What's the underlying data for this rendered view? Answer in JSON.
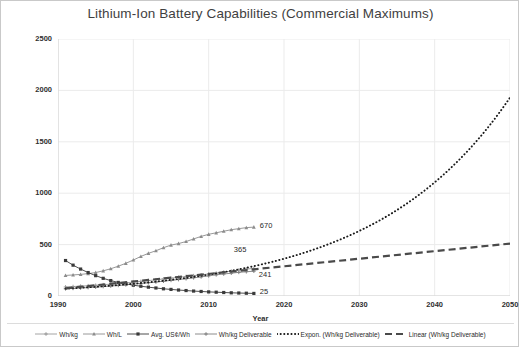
{
  "chart_data": {
    "type": "line",
    "title": "Lithium-Ion Battery Capabilities (Commercial Maximums)",
    "xlabel": "Year",
    "ylabel": "Value (See Legend)",
    "xlim": [
      1990,
      2050
    ],
    "ylim": [
      0,
      2500
    ],
    "xticks": [
      "1990",
      "2000",
      "2010",
      "2020",
      "2030",
      "2040",
      "2050"
    ],
    "yticks": [
      "0",
      "500",
      "1000",
      "1500",
      "2000",
      "2500"
    ],
    "grid": true,
    "legend_position": "bottom",
    "series": [
      {
        "name": "Wh/kg",
        "marker": "cross",
        "style": "solid",
        "x": [
          1991,
          1992,
          1993,
          1994,
          1995,
          1996,
          1997,
          1998,
          1999,
          2000,
          2001,
          2002,
          2003,
          2004,
          2005,
          2006,
          2007,
          2008,
          2009,
          2010,
          2011,
          2012,
          2013,
          2014,
          2015,
          2016
        ],
        "values": [
          88,
          92,
          96,
          100,
          104,
          110,
          115,
          122,
          128,
          135,
          142,
          150,
          158,
          166,
          174,
          182,
          190,
          198,
          206,
          214,
          222,
          232,
          242,
          252,
          262,
          268
        ]
      },
      {
        "name": "Wh/L",
        "marker": "triangle",
        "style": "solid",
        "x": [
          1991,
          1992,
          1993,
          1994,
          1995,
          1996,
          1997,
          1998,
          1999,
          2000,
          2001,
          2002,
          2003,
          2004,
          2005,
          2006,
          2007,
          2008,
          2009,
          2010,
          2011,
          2012,
          2013,
          2014,
          2015,
          2016
        ],
        "values": [
          200,
          205,
          210,
          218,
          228,
          245,
          265,
          290,
          318,
          350,
          385,
          415,
          440,
          470,
          495,
          510,
          530,
          555,
          580,
          600,
          615,
          630,
          645,
          655,
          665,
          670
        ]
      },
      {
        "name": "Avg. US¢/Wh",
        "marker": "square",
        "style": "solid",
        "x": [
          1991,
          1992,
          1993,
          1994,
          1995,
          1996,
          1997,
          1998,
          1999,
          2000,
          2001,
          2002,
          2003,
          2004,
          2005,
          2006,
          2007,
          2008,
          2009,
          2010,
          2011,
          2012,
          2013,
          2014,
          2015,
          2016
        ],
        "values": [
          345,
          300,
          262,
          228,
          198,
          172,
          150,
          132,
          118,
          105,
          95,
          86,
          78,
          70,
          64,
          58,
          53,
          48,
          44,
          40,
          37,
          34,
          31,
          29,
          27,
          25
        ]
      },
      {
        "name": "Wh/kg Deliverable",
        "marker": "cross",
        "style": "solid",
        "x": [
          1991,
          1992,
          1993,
          1994,
          1995,
          1996,
          1997,
          1998,
          1999,
          2000,
          2001,
          2002,
          2003,
          2004,
          2005,
          2006,
          2007,
          2008,
          2009,
          2010,
          2011,
          2012,
          2013,
          2014,
          2015,
          2016
        ],
        "values": [
          70,
          74,
          78,
          82,
          86,
          92,
          97,
          103,
          109,
          115,
          122,
          129,
          136,
          144,
          152,
          160,
          168,
          177,
          186,
          196,
          206,
          214,
          222,
          230,
          236,
          241
        ]
      },
      {
        "name": "Expon. (Wh/kg Deliverable)",
        "style": "dotted",
        "trend": "exponential",
        "x": [
          1991,
          2050
        ],
        "values": [
          72,
          1930
        ]
      },
      {
        "name": "Linear (Wh/kg Deliverable)",
        "style": "dashed",
        "trend": "linear",
        "x": [
          1991,
          2050
        ],
        "values": [
          75,
          510
        ]
      }
    ],
    "annotations": [
      {
        "label": "670",
        "x": 2016,
        "y": 670,
        "series": "Wh/L"
      },
      {
        "label": "365",
        "x": 2016,
        "y": 365,
        "series": "Expon. (Wh/kg Deliverable)"
      },
      {
        "label": "241",
        "x": 2016,
        "y": 241,
        "series": "Wh/kg Deliverable"
      },
      {
        "label": "25",
        "x": 2016,
        "y": 25,
        "series": "Avg. US¢/Wh"
      }
    ],
    "colors": {
      "title": "#3f3f3f",
      "axis_text": "#2f2f2f",
      "grid": "#ebebeb",
      "series_wh_kg": "#9a9a9a",
      "series_wh_l": "#8c8c8c",
      "series_cents": "#3a3a3a",
      "series_deliverable": "#808080",
      "trend_expon": "#1a1a1a",
      "trend_linear": "#4a4a4a",
      "border": "#c9c9c9"
    }
  },
  "legend": {
    "items": [
      {
        "label": "Wh/kg",
        "symbol": "cross-marker"
      },
      {
        "label": "Wh/L",
        "symbol": "triangle-marker"
      },
      {
        "label": "Avg. US¢/Wh",
        "symbol": "square-marker"
      },
      {
        "label": "Wh/kg Deliverable",
        "symbol": "cross-marker"
      },
      {
        "label": "Expon. (Wh/kg Deliverable)",
        "symbol": "dotted-line"
      },
      {
        "label": "Linear (Wh/kg Deliverable)",
        "symbol": "dashed-line"
      }
    ]
  }
}
